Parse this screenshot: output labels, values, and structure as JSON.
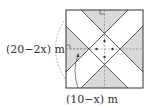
{
  "diagram": {
    "type": "geometry",
    "labels": {
      "left_dimension": "(20−2x) m",
      "bottom_dimension": "(10−x) m"
    },
    "colors": {
      "shaded": "#d9d9d9",
      "road": "#ffffff",
      "outline": "#333333",
      "dashed": "#777777"
    },
    "square": {
      "x": 66,
      "y": 10,
      "size": 77
    },
    "road_width": 11
  }
}
